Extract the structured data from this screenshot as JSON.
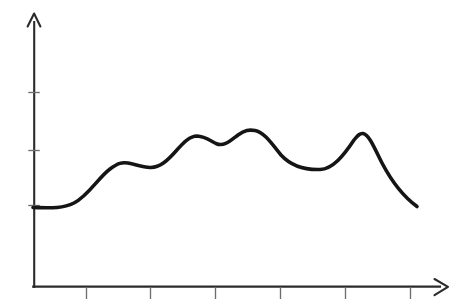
{
  "chart_data": {
    "type": "line",
    "title": "",
    "subtitle": "",
    "xlabel": "",
    "ylabel": "",
    "style": "hand-drawn sketch",
    "grid": false,
    "legend": false,
    "legend_position": "none",
    "axis_color": "#2b2b2b",
    "curve_color": "#151515",
    "background_color": "#ffffff",
    "xlim": [
      0,
      6.35
    ],
    "ylim": [
      0,
      4.6
    ],
    "x_tick_labels": [
      "",
      "",
      "",
      "",
      "",
      ""
    ],
    "y_tick_labels": [
      "",
      "",
      ""
    ],
    "x_ticks": [
      1,
      2,
      3,
      4,
      5,
      6
    ],
    "y_ticks": [
      1,
      2,
      3
    ],
    "x_axis_arrow": true,
    "y_axis_arrow": true,
    "series": [
      {
        "name": "series-1",
        "x": [
          0.0,
          0.35,
          0.7,
          1.0,
          1.43,
          1.8,
          2.1,
          2.5,
          2.85,
          3.38,
          3.7,
          4.1,
          4.4,
          4.82,
          5.05,
          5.4,
          5.9
        ],
        "y": [
          1.0,
          1.02,
          1.28,
          1.62,
          1.68,
          1.62,
          2.08,
          1.97,
          2.22,
          2.28,
          1.93,
          1.38,
          1.28,
          1.75,
          2.19,
          1.87,
          1.02
        ]
      }
    ],
    "annotations": [],
    "points_px": {
      "origin": [
        34,
        287
      ],
      "y_axis_top": [
        34,
        13
      ],
      "x_axis_end": [
        448,
        287
      ],
      "curve_start": [
        33,
        207
      ],
      "curve_end": [
        417,
        206
      ],
      "y_tick_y": [
        92,
        150,
        205
      ],
      "x_tick_x": [
        86,
        150,
        215,
        280,
        345,
        410
      ],
      "local_max_1": [
        127,
        163
      ],
      "local_min_1": [
        152,
        167
      ],
      "local_max_2": [
        197,
        136
      ],
      "local_min_2": [
        216,
        143
      ],
      "global_max": [
        253,
        130
      ],
      "valley": [
        320,
        169
      ],
      "local_max_3": [
        362,
        133
      ]
    }
  },
  "elements": {
    "y_axis_name": "y-axis",
    "x_axis_name": "x-axis",
    "curve_name": "data-curve"
  }
}
